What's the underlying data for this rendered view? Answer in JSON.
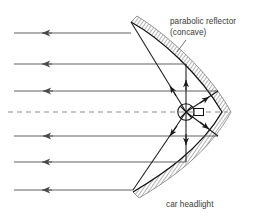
{
  "figure": {
    "width": 256,
    "height": 217,
    "background": "#ffffff",
    "labels": {
      "reflector_line1": "parabolic reflector",
      "reflector_line2": "(concave)",
      "headlight": "car headlight"
    },
    "colors": {
      "ray": "#4a4a4a",
      "beam_ray": "#555555",
      "reflector_outline": "#111111",
      "hatch": "#8a8a8a",
      "axis_dashed": "#8a8a8a",
      "bulb": "#111111",
      "text": "#3a3a3a"
    },
    "parabola": {
      "vertex_x": 222,
      "vertex_y": 112,
      "top_end_x": 131,
      "top_end_y": 22,
      "bottom_end_x": 133,
      "bottom_end_y": 192,
      "focus_x": 186,
      "focus_y": 112,
      "orientation": "opens-left"
    },
    "bulb": {
      "center_x": 186,
      "center_y": 112,
      "radius": 8,
      "filament_marker": "x-cross",
      "holder_x": 198,
      "holder_y": 112,
      "holder_w": 9,
      "holder_h": 7
    },
    "axis": {
      "style": "dashed",
      "y": 112,
      "x_start": 8,
      "x_end": 226
    },
    "outgoing_rays": [
      {
        "y": 33,
        "x_start": 131,
        "x_end": 14,
        "arrow_x": 44,
        "direction": "left"
      },
      {
        "y": 64,
        "x_start": 186,
        "x_end": 14,
        "arrow_x": 44,
        "direction": "left"
      },
      {
        "y": 91,
        "x_start": 216,
        "x_end": 14,
        "arrow_x": 45,
        "direction": "left"
      },
      {
        "y": 136,
        "x_start": 216,
        "x_end": 14,
        "arrow_x": 45,
        "direction": "left"
      },
      {
        "y": 162,
        "x_start": 186,
        "x_end": 14,
        "arrow_x": 44,
        "direction": "left"
      },
      {
        "y": 190,
        "x_start": 133,
        "x_end": 14,
        "arrow_x": 44,
        "direction": "left"
      }
    ],
    "source_rays": [
      {
        "from": [
          186,
          112
        ],
        "to": [
          131,
          22
        ],
        "arrow_at": [
          168,
          82
        ],
        "label": "ray-to-upper-rim"
      },
      {
        "from": [
          186,
          112
        ],
        "to": [
          186,
          64
        ],
        "arrow_at": [
          186,
          80
        ],
        "label": "ray-up-vertical"
      },
      {
        "from": [
          186,
          112
        ],
        "to": [
          216,
          91
        ],
        "arrow_at": [
          206,
          98
        ],
        "label": "ray-upper-right"
      },
      {
        "from": [
          186,
          112
        ],
        "to": [
          216,
          136
        ],
        "arrow_at": [
          206,
          127
        ],
        "label": "ray-lower-right"
      },
      {
        "from": [
          186,
          112
        ],
        "to": [
          186,
          162
        ],
        "arrow_at": [
          186,
          146
        ],
        "label": "ray-down-vertical"
      },
      {
        "from": [
          186,
          112
        ],
        "to": [
          133,
          190
        ],
        "arrow_at": [
          168,
          140
        ],
        "label": "ray-to-lower-rim"
      }
    ]
  }
}
